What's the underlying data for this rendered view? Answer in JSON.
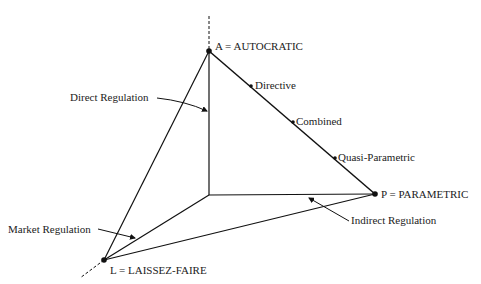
{
  "diagram": {
    "top_caption_cut": "... topology of economic ... policy ...",
    "vertices": {
      "autocratic": "A = AUTOCRATIC",
      "parametric": "P = PARAMETRIC",
      "laissez_faire": "L = LAISSEZ-FAIRE"
    },
    "edge_points": {
      "directive": "Directive",
      "combined": "Combined",
      "quasi_parametric": "Quasi-Parametric"
    },
    "regulations": {
      "direct": "Direct Regulation",
      "indirect": "Indirect Regulation",
      "market": "Market Regulation"
    },
    "colors": {
      "line": "#111111",
      "text": "#222222",
      "background": "#ffffff"
    }
  }
}
